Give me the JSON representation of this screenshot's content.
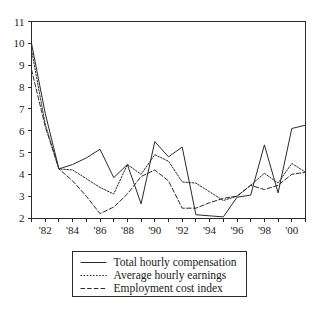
{
  "chart_data": {
    "type": "line",
    "title": "",
    "subtitle": "",
    "xlabel": "",
    "ylabel": "",
    "xlim": [
      1981,
      2001
    ],
    "ylim": [
      2,
      11
    ],
    "grid": false,
    "legend_position": "bottom",
    "x": [
      1981,
      1982,
      1983,
      1984,
      1985,
      1986,
      1987,
      1988,
      1989,
      1990,
      1991,
      1992,
      1993,
      1994,
      1995,
      1996,
      1997,
      1998,
      1999,
      2000,
      2001
    ],
    "x_tick_labels": [
      "",
      "'82",
      "",
      "'84",
      "",
      "'86",
      "",
      "'88",
      "",
      "'90",
      "",
      "'92",
      "",
      "'94",
      "",
      "'96",
      "",
      "'98",
      "",
      "'00",
      ""
    ],
    "y_tick_labels": [
      "2",
      "3",
      "4",
      "5",
      "6",
      "7",
      "8",
      "9",
      "10",
      "11"
    ],
    "y_ticks": [
      2,
      3,
      4,
      5,
      6,
      7,
      8,
      9,
      10,
      11
    ],
    "series": [
      {
        "name": "Total hourly compensation",
        "style": "solid",
        "values": [
          10.0,
          6.8,
          4.25,
          4.45,
          4.75,
          5.15,
          3.85,
          4.45,
          2.65,
          5.5,
          4.8,
          5.25,
          2.15,
          2.1,
          2.05,
          2.95,
          3.05,
          5.35,
          3.15,
          6.1,
          6.25
        ]
      },
      {
        "name": "Average hourly earnings",
        "style": "dotted",
        "values": [
          9.7,
          6.3,
          4.25,
          4.2,
          3.8,
          3.4,
          3.1,
          4.45,
          4.0,
          4.9,
          4.6,
          3.65,
          3.6,
          3.2,
          2.8,
          3.0,
          3.5,
          4.05,
          3.6,
          4.5,
          4.1
        ]
      },
      {
        "name": "Employment cost index",
        "style": "dashed",
        "values": [
          8.8,
          6.2,
          4.25,
          3.7,
          3.0,
          2.2,
          2.5,
          3.1,
          3.9,
          4.2,
          3.7,
          2.45,
          2.45,
          2.7,
          2.9,
          3.0,
          3.5,
          3.3,
          3.5,
          4.0,
          4.1
        ]
      }
    ]
  },
  "legend": {
    "items": [
      {
        "label": "Total hourly compensation",
        "style": "solid"
      },
      {
        "label": "Average hourly earnings",
        "style": "dotted"
      },
      {
        "label": "Employment cost index",
        "style": "dashed"
      }
    ]
  }
}
